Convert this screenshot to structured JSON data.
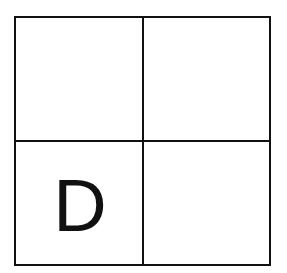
{
  "grid": {
    "rows": 2,
    "cols": 2,
    "line_color": "#111111",
    "cells": [
      {
        "label": ""
      },
      {
        "label": ""
      },
      {
        "label": "D"
      },
      {
        "label": ""
      }
    ]
  }
}
